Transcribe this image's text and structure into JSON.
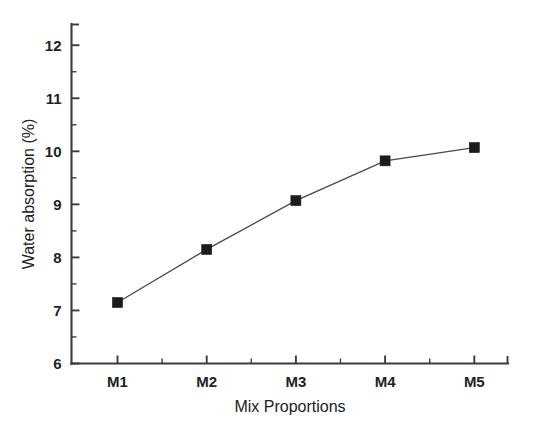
{
  "chart_data": {
    "type": "line",
    "title": "",
    "subtitle": "",
    "xlabel": "Mix Proportions",
    "ylabel": "Water absorption (%)",
    "categories": [
      "M1",
      "M2",
      "M3",
      "M4",
      "M5"
    ],
    "values": [
      7.15,
      8.15,
      9.07,
      9.82,
      10.07
    ],
    "series": [
      {
        "name": "Water absorption",
        "values": [
          7.15,
          8.15,
          9.07,
          9.82,
          10.07
        ],
        "marker": "filled-square",
        "marker_color": "#1c1c1c",
        "line_color": "#4a4a4a"
      }
    ],
    "ylim": [
      6,
      12.4
    ],
    "ytick_labels": [
      "6",
      "7",
      "8",
      "9",
      "10",
      "11",
      "12"
    ],
    "ytick_values": [
      6,
      7,
      8,
      9,
      10,
      11,
      12
    ],
    "y_minor_ticks_between": 1,
    "xtick_labels": [
      "M1",
      "M2",
      "M3",
      "M4",
      "M5"
    ],
    "x_minor_ticks_between": 1,
    "grid": false,
    "legend": false,
    "legend_position": "none",
    "frame": "left-bottom",
    "tick_direction": "in",
    "annotations": [],
    "background_color": "#ffffff",
    "axis_color": "#3c3c3c"
  }
}
